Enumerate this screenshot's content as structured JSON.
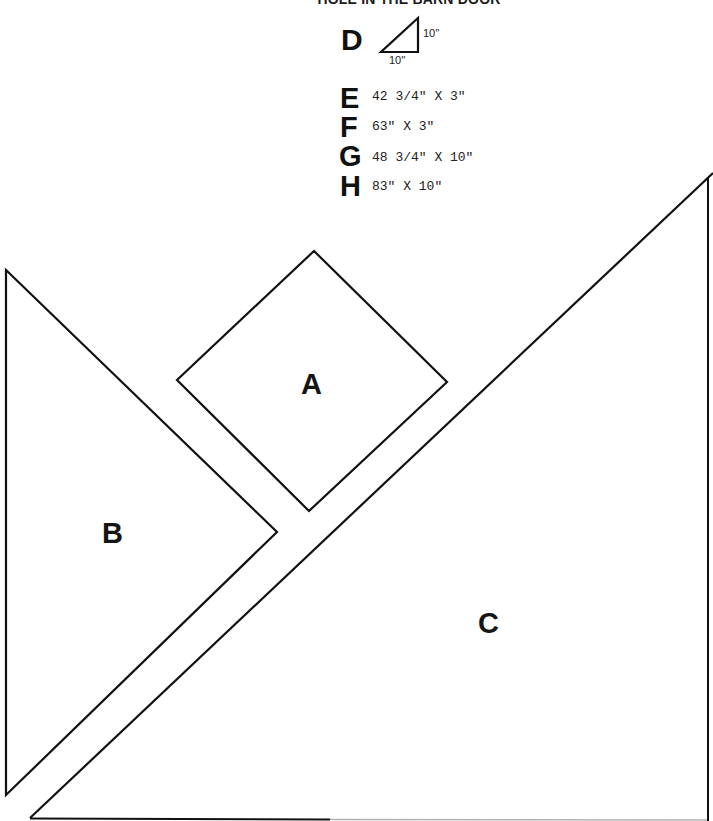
{
  "title": "HOLE IN THE BARN DOOR",
  "key": {
    "D": {
      "letter": "D",
      "leg_vertical": "10''",
      "leg_horizontal": "10''",
      "shape": "right-triangle"
    },
    "E": {
      "letter": "E",
      "dimensions": "42 3/4\" X 3\""
    },
    "F": {
      "letter": "F",
      "dimensions": "63\" X 3\""
    },
    "G": {
      "letter": "G",
      "dimensions": "48 3/4\" X 10\""
    },
    "H": {
      "letter": "H",
      "dimensions": "83\" X 10\""
    }
  },
  "pieces": {
    "A": {
      "label": "A",
      "shape": "square-on-point"
    },
    "B": {
      "label": "B",
      "shape": "right-triangle"
    },
    "C": {
      "label": "C",
      "shape": "right-triangle"
    }
  },
  "colors": {
    "line": "#111111",
    "background": "#ffffff"
  }
}
